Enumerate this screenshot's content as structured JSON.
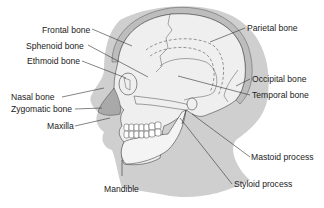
{
  "diagram": {
    "colors": {
      "background": "#ffffff",
      "head_silhouette": "#cfcfcf",
      "skull_fill": "#efefef",
      "skull_rim": "#bdbdbd",
      "nasal_cartilage": "#a9a9a9",
      "line": "#333333",
      "text": "#222222"
    },
    "labels": {
      "frontal": "Frontal bone",
      "sphenoid": "Sphenoid bone",
      "ethmoid": "Ethmoid bone",
      "nasal": "Nasal bone",
      "zygomatic": "Zygomatic bone",
      "maxilla": "Maxilla",
      "mandible": "Mandible",
      "parietal": "Parietal bone",
      "occipital": "Occipital bone",
      "temporal": "Temporal bone",
      "mastoid": "Mastoid process",
      "styloid": "Styloid process"
    }
  }
}
